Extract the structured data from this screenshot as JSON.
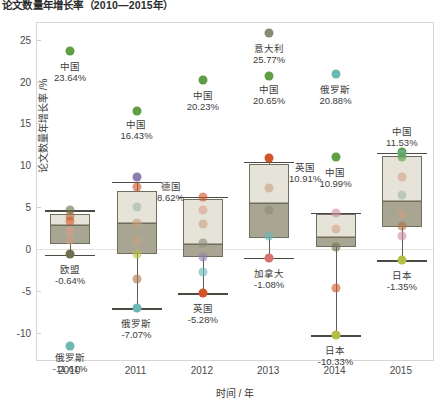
{
  "title": "论文数量年增长率（2010—2015年）",
  "axes": {
    "ylabel": "论文数量年增长率 /%",
    "xlabel": "时间 / 年",
    "yticks": [
      25,
      20,
      15,
      10,
      5,
      0,
      -5,
      -10
    ],
    "xticks": [
      "2010",
      "2011",
      "2012",
      "2013",
      "2014",
      "2015"
    ],
    "ylim": [
      -13.5,
      27.0
    ]
  },
  "colors": {
    "box_upper": "#e6e4d8",
    "box_lower": "#a8a692",
    "box_edge": "#6f6f5e",
    "zero_line": "#e8e0dc",
    "frame": "#d6d6d6",
    "china": "#5f9e43",
    "russia": "#6cb8b4",
    "germany": "#8e7fb0",
    "uk": "#d2552a",
    "italy": "#8a8a72",
    "canada": "#d6736e",
    "japan": "#b6bf45",
    "eu": "#6e6f4e",
    "usa": "#b0754a",
    "france": "#d9a08c",
    "india": "#c8a07f",
    "southkorea": "#cf8fa5",
    "brazil": "#9fb8a8"
  },
  "chart_data": {
    "type": "box",
    "title": "论文数量年增长率（2010—2015年）",
    "xlabel": "时间 / 年",
    "ylabel": "论文数量年增长率 /%",
    "ylim": [
      -13.5,
      27.0
    ],
    "categories": [
      "2010",
      "2011",
      "2012",
      "2013",
      "2014",
      "2015"
    ],
    "boxes": [
      {
        "year": "2010",
        "whisker_low": -0.7,
        "q1": 0.6,
        "median": 2.9,
        "q3": 4.2,
        "whisker_high": 4.6
      },
      {
        "year": "2011",
        "whisker_low": -7.07,
        "q1": -0.6,
        "median": 3.1,
        "q3": 6.9,
        "whisker_high": 8.0
      },
      {
        "year": "2012",
        "whisker_low": -5.28,
        "q1": -1.0,
        "median": 0.6,
        "q3": 6.0,
        "whisker_high": 6.2
      },
      {
        "year": "2013",
        "whisker_low": -1.08,
        "q1": 1.3,
        "median": 5.5,
        "q3": 10.2,
        "whisker_high": 10.4
      },
      {
        "year": "2014",
        "whisker_low": -10.33,
        "q1": 0.2,
        "median": 1.4,
        "q3": 4.2,
        "whisker_high": 4.3
      },
      {
        "year": "2015",
        "whisker_low": -1.35,
        "q1": 2.6,
        "median": 5.7,
        "q3": 11.1,
        "whisker_high": 11.5
      }
    ],
    "points": [
      {
        "year": "2010",
        "value": 23.64,
        "country": "中国",
        "color": "china",
        "labeled": true
      },
      {
        "year": "2010",
        "value": 4.6,
        "country": "欧盟",
        "color": "eu",
        "labeled": false
      },
      {
        "year": "2010",
        "value": 4.0,
        "country": "美国",
        "color": "usa",
        "labeled": false
      },
      {
        "year": "2010",
        "value": 3.4,
        "country": "英国",
        "color": "uk",
        "labeled": false
      },
      {
        "year": "2010",
        "value": 2.2,
        "country": "法国",
        "color": "france",
        "labeled": false
      },
      {
        "year": "2010",
        "value": 1.1,
        "country": "印度",
        "color": "india",
        "labeled": false
      },
      {
        "year": "2010",
        "value": -0.64,
        "country": "欧盟",
        "color": "eu",
        "labeled": true
      },
      {
        "year": "2010",
        "value": -11.61,
        "country": "俄罗斯",
        "color": "russia",
        "labeled": true
      },
      {
        "year": "2011",
        "value": 16.43,
        "country": "中国",
        "color": "china",
        "labeled": true
      },
      {
        "year": "2011",
        "value": 8.62,
        "country": "德国",
        "color": "germany",
        "labeled": true
      },
      {
        "year": "2011",
        "value": 7.4,
        "country": "英国",
        "color": "uk",
        "labeled": false
      },
      {
        "year": "2011",
        "value": 5.0,
        "country": "韩国",
        "color": "brazil",
        "labeled": false
      },
      {
        "year": "2011",
        "value": 3.1,
        "country": "印度",
        "color": "india",
        "labeled": false
      },
      {
        "year": "2011",
        "value": 1.0,
        "country": "美国",
        "color": "india",
        "labeled": false
      },
      {
        "year": "2011",
        "value": -0.6,
        "country": "日本",
        "color": "japan",
        "labeled": false
      },
      {
        "year": "2011",
        "value": -3.6,
        "country": "法国",
        "color": "usa",
        "labeled": false
      },
      {
        "year": "2011",
        "value": -7.07,
        "country": "俄罗斯",
        "color": "russia",
        "labeled": true
      },
      {
        "year": "2012",
        "value": 20.23,
        "country": "中国",
        "color": "china",
        "labeled": true
      },
      {
        "year": "2012",
        "value": 6.2,
        "country": "美国",
        "color": "uk",
        "labeled": false
      },
      {
        "year": "2012",
        "value": 4.6,
        "country": "德国",
        "color": "france",
        "labeled": false
      },
      {
        "year": "2012",
        "value": 3.0,
        "country": "印度",
        "color": "india",
        "labeled": false
      },
      {
        "year": "2012",
        "value": 0.7,
        "country": "法国",
        "color": "italy",
        "labeled": false
      },
      {
        "year": "2012",
        "value": -1.0,
        "country": "日本",
        "color": "germany",
        "labeled": false
      },
      {
        "year": "2012",
        "value": -2.8,
        "country": "俄罗斯",
        "color": "russia",
        "labeled": false
      },
      {
        "year": "2012",
        "value": -5.28,
        "country": "英国",
        "color": "uk",
        "labeled": true
      },
      {
        "year": "2013",
        "value": 25.77,
        "country": "意大利",
        "color": "italy",
        "labeled": true
      },
      {
        "year": "2013",
        "value": 20.65,
        "country": "中国",
        "color": "china",
        "labeled": true
      },
      {
        "year": "2013",
        "value": 10.91,
        "country": "英国",
        "color": "uk",
        "labeled": true
      },
      {
        "year": "2013",
        "value": 7.3,
        "country": "印度",
        "color": "india",
        "labeled": false
      },
      {
        "year": "2013",
        "value": 4.6,
        "country": "德国",
        "color": "italy",
        "labeled": false
      },
      {
        "year": "2013",
        "value": 1.5,
        "country": "俄罗斯",
        "color": "russia",
        "labeled": false
      },
      {
        "year": "2013",
        "value": -1.08,
        "country": "加拿大",
        "color": "canada",
        "labeled": true
      },
      {
        "year": "2014",
        "value": 20.88,
        "country": "俄罗斯",
        "color": "russia",
        "labeled": true
      },
      {
        "year": "2014",
        "value": 10.99,
        "country": "中国",
        "color": "china",
        "labeled": true
      },
      {
        "year": "2014",
        "value": 4.3,
        "country": "印度",
        "color": "southkorea",
        "labeled": false
      },
      {
        "year": "2014",
        "value": 2.4,
        "country": "美国",
        "color": "france",
        "labeled": false
      },
      {
        "year": "2014",
        "value": 0.2,
        "country": "德国",
        "color": "eu",
        "labeled": false
      },
      {
        "year": "2014",
        "value": -4.6,
        "country": "英国",
        "color": "uk",
        "labeled": false
      },
      {
        "year": "2014",
        "value": -10.33,
        "country": "日本",
        "color": "japan",
        "labeled": true
      },
      {
        "year": "2015",
        "value": 11.53,
        "country": "中国",
        "color": "china",
        "labeled": true
      },
      {
        "year": "2015",
        "value": 11.3,
        "country": "俄罗斯",
        "color": "russia",
        "labeled": false
      },
      {
        "year": "2015",
        "value": 11.0,
        "country": "中国",
        "color": "china",
        "labeled": false
      },
      {
        "year": "2015",
        "value": 8.6,
        "country": "法国",
        "color": "france",
        "labeled": false
      },
      {
        "year": "2015",
        "value": 6.4,
        "country": "印度",
        "color": "brazil",
        "labeled": false
      },
      {
        "year": "2015",
        "value": 4.2,
        "country": "美国",
        "color": "india",
        "labeled": false
      },
      {
        "year": "2015",
        "value": 2.7,
        "country": "德国",
        "color": "usa",
        "labeled": false
      },
      {
        "year": "2015",
        "value": 1.6,
        "country": "英国",
        "color": "southkorea",
        "labeled": false
      },
      {
        "year": "2015",
        "value": -1.35,
        "country": "日本",
        "color": "japan",
        "labeled": true
      }
    ],
    "annotations": [
      {
        "year": "2010",
        "value": 23.64,
        "name": "中国",
        "text": "23.64%",
        "dx": 0,
        "dy": 10
      },
      {
        "year": "2010",
        "value": -0.64,
        "name": "欧盟",
        "text": "-0.64%",
        "dx": 0,
        "dy": 10
      },
      {
        "year": "2010",
        "value": -11.61,
        "name": "俄罗斯",
        "text": "-11.61%",
        "dx": 0,
        "dy": 6
      },
      {
        "year": "2011",
        "value": 16.43,
        "name": "中国",
        "text": "16.43%",
        "dx": 0,
        "dy": 8
      },
      {
        "year": "2011",
        "value": 8.62,
        "name": "德国",
        "text": "8.62%",
        "dx": 34,
        "dy": 4
      },
      {
        "year": "2011",
        "value": -7.07,
        "name": "俄罗斯",
        "text": "-7.07%",
        "dx": 0,
        "dy": 10
      },
      {
        "year": "2012",
        "value": 20.23,
        "name": "中国",
        "text": "20.23%",
        "dx": 0,
        "dy": 10
      },
      {
        "year": "2012",
        "value": -5.28,
        "name": "英国",
        "text": "-5.28%",
        "dx": 0,
        "dy": 10
      },
      {
        "year": "2013",
        "value": 25.77,
        "name": "意大利",
        "text": "25.77%",
        "dx": 0,
        "dy": 10
      },
      {
        "year": "2013",
        "value": 20.65,
        "name": "中国",
        "text": "20.65%",
        "dx": 0,
        "dy": 8
      },
      {
        "year": "2013",
        "value": 10.91,
        "name": "英国",
        "text": "10.91%",
        "dx": 36,
        "dy": 4
      },
      {
        "year": "2013",
        "value": -1.08,
        "name": "加拿大",
        "text": "-1.08%",
        "dx": 0,
        "dy": 10
      },
      {
        "year": "2014",
        "value": 20.88,
        "name": "俄罗斯",
        "text": "20.88%",
        "dx": 0,
        "dy": 10
      },
      {
        "year": "2014",
        "value": 10.99,
        "name": "中国",
        "text": "10.99%",
        "dx": 0,
        "dy": 10
      },
      {
        "year": "2014",
        "value": -10.33,
        "name": "日本",
        "text": "-10.33%",
        "dx": 0,
        "dy": 10
      },
      {
        "year": "2015",
        "value": 11.53,
        "name": "中国",
        "text": "11.53%",
        "dx": 0,
        "dy": -26
      },
      {
        "year": "2015",
        "value": -1.35,
        "name": "日本",
        "text": "-1.35%",
        "dx": 0,
        "dy": 10
      }
    ]
  }
}
